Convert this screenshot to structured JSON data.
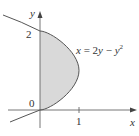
{
  "diagram": {
    "equation": {
      "lhs": "x",
      "mid": " = 2",
      "y1": "y",
      "minus": " − ",
      "y2": "y",
      "exp": "2"
    },
    "axes": {
      "x_label": "x",
      "y_label": "y",
      "x_ticks": [
        "1"
      ],
      "y_ticks": [
        "0",
        "2"
      ]
    },
    "curve": "x = 2y − y^2",
    "shaded_region": "between y-axis and curve for 0 ≤ y ≤ 2",
    "colors": {
      "shade": "#d9d9d9",
      "line": "#555555",
      "axis": "#666666"
    }
  }
}
